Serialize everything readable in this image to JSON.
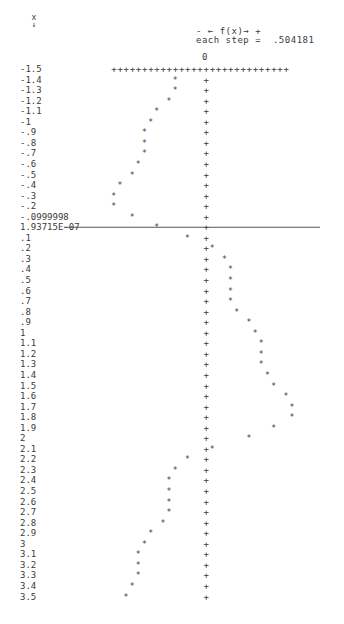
{
  "header": {
    "x_label": "x",
    "x_arrow": "↓",
    "direction_legend": "- ← f(x)→ +",
    "step_label": "each step =",
    "step_value": ".504181",
    "zero_label": "0"
  },
  "chart_data": {
    "type": "scatter",
    "title": "",
    "xlabel": "x",
    "ylabel": "f(x)",
    "orientation": "vertical x axis (rows), f(x) horizontal (columns)",
    "step": 0.504181,
    "marker": "*",
    "axis_marker": "+",
    "x_ticks": [
      "-1.5",
      "-1.4",
      "-1.3",
      "-1.2",
      "-1.1",
      "-1",
      "-.9",
      "-.8",
      "-.7",
      "-.6",
      "-.5",
      "-.4",
      "-.3",
      "-.2",
      "-.0999998",
      "1.93715E-07",
      ".1",
      ".2",
      ".3",
      ".4",
      ".5",
      ".6",
      ".7",
      ".8",
      ".9",
      "1",
      "1.1",
      "1.2",
      "1.3",
      "1.4",
      "1.5",
      "1.6",
      "1.7",
      "1.8",
      "1.9",
      "2",
      "2.1",
      "2.2",
      "2.3",
      "2.4",
      "2.5",
      "2.6",
      "2.7",
      "2.8",
      "2.9",
      "3",
      "3.1",
      "3.2",
      "3.3",
      "3.4",
      "3.5"
    ],
    "x": [
      -1.5,
      -1.4,
      -1.3,
      -1.2,
      -1.1,
      -1,
      -0.9,
      -0.8,
      -0.7,
      -0.6,
      -0.5,
      -0.4,
      -0.3,
      -0.2,
      -0.0999998,
      1.93715e-07,
      0.1,
      0.2,
      0.3,
      0.4,
      0.5,
      0.6,
      0.7,
      0.8,
      0.9,
      1,
      1.1,
      1.2,
      1.3,
      1.4,
      1.5,
      1.6,
      1.7,
      1.8,
      1.9,
      2,
      2.1,
      2.2,
      2.3,
      2.4,
      2.5,
      2.6,
      2.7,
      2.8,
      2.9,
      3,
      3.1,
      3.2,
      3.3,
      3.4,
      3.5
    ],
    "steps_from_zero": [
      null,
      -5,
      -5,
      -6,
      -8,
      -9,
      -10,
      -10,
      -10,
      -11,
      -12,
      -14,
      -15,
      -15,
      -12,
      -8,
      -3,
      1,
      3,
      4,
      4,
      4,
      4,
      5,
      7,
      8,
      9,
      9,
      9,
      10,
      11,
      13,
      14,
      14,
      11,
      7,
      1,
      -3,
      -5,
      -6,
      -6,
      -6,
      -6,
      -7,
      -9,
      -10,
      -11,
      -11,
      -11,
      -12,
      -13
    ],
    "f_values": [
      null,
      -2.52,
      -2.52,
      -3.03,
      -4.03,
      -4.54,
      -5.04,
      -5.04,
      -5.04,
      -5.55,
      -6.05,
      -7.06,
      -7.56,
      -7.56,
      -6.05,
      -4.03,
      -1.51,
      0.5,
      1.51,
      2.02,
      2.02,
      2.02,
      2.02,
      2.52,
      3.53,
      4.03,
      4.54,
      4.54,
      4.54,
      5.04,
      5.55,
      6.55,
      7.06,
      7.06,
      5.55,
      3.53,
      0.5,
      -1.51,
      -2.52,
      -3.03,
      -3.03,
      -3.03,
      -3.03,
      -3.53,
      -4.54,
      -5.04,
      -5.55,
      -5.55,
      -5.55,
      -6.05,
      -6.55
    ],
    "top_ruler_steps": [
      -15,
      13
    ],
    "zero_line_row": "1.93715E-07"
  }
}
